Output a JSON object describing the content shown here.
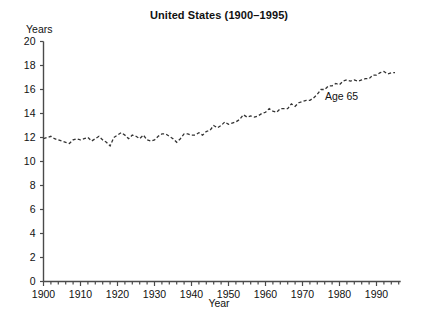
{
  "chart_data": {
    "type": "line",
    "title": "United States (1900–1995)",
    "xlabel": "Year",
    "ylabel": "Years",
    "xlim": [
      1900,
      1996
    ],
    "ylim": [
      0,
      20
    ],
    "grid": false,
    "legend_position": "inline-annotation",
    "line_style": "dashed",
    "line_color": "#333333",
    "annotations": [
      {
        "text": "Age 65",
        "x": 1982,
        "y": 15.4
      }
    ],
    "y_ticks": [
      0,
      2,
      4,
      6,
      8,
      10,
      12,
      14,
      16,
      18,
      20
    ],
    "x_ticks": [
      1900,
      1910,
      1920,
      1930,
      1940,
      1950,
      1960,
      1970,
      1980,
      1990
    ],
    "x_minor_tick_step": 2,
    "series": [
      {
        "name": "Age 65",
        "x": [
          1900,
          1901,
          1902,
          1903,
          1904,
          1905,
          1906,
          1907,
          1908,
          1909,
          1910,
          1911,
          1912,
          1913,
          1914,
          1915,
          1916,
          1917,
          1918,
          1919,
          1920,
          1921,
          1922,
          1923,
          1924,
          1925,
          1926,
          1927,
          1928,
          1929,
          1930,
          1931,
          1932,
          1933,
          1934,
          1935,
          1936,
          1937,
          1938,
          1939,
          1940,
          1941,
          1942,
          1943,
          1944,
          1945,
          1946,
          1947,
          1948,
          1949,
          1950,
          1951,
          1952,
          1953,
          1954,
          1955,
          1956,
          1957,
          1958,
          1959,
          1960,
          1961,
          1962,
          1963,
          1964,
          1965,
          1966,
          1967,
          1968,
          1969,
          1970,
          1971,
          1972,
          1973,
          1974,
          1975,
          1976,
          1977,
          1978,
          1979,
          1980,
          1981,
          1982,
          1983,
          1984,
          1985,
          1986,
          1987,
          1988,
          1989,
          1990,
          1991,
          1992,
          1993,
          1994,
          1995
        ],
        "values": [
          11.9,
          12.0,
          12.1,
          11.9,
          11.8,
          11.7,
          11.6,
          11.5,
          11.8,
          11.9,
          11.8,
          11.9,
          12.0,
          11.7,
          11.9,
          12.1,
          11.8,
          11.6,
          11.3,
          12.0,
          12.2,
          12.4,
          12.2,
          11.9,
          12.2,
          12.1,
          11.9,
          12.2,
          11.8,
          11.7,
          11.8,
          12.1,
          12.3,
          12.3,
          12.1,
          11.9,
          11.6,
          11.9,
          12.3,
          12.3,
          12.2,
          12.2,
          12.4,
          12.2,
          12.5,
          12.6,
          13.0,
          12.8,
          13.0,
          13.3,
          13.1,
          13.2,
          13.3,
          13.5,
          13.9,
          13.7,
          13.8,
          13.7,
          13.8,
          14.0,
          14.1,
          14.4,
          14.2,
          14.1,
          14.4,
          14.4,
          14.4,
          14.8,
          14.6,
          14.9,
          15.0,
          15.1,
          15.1,
          15.3,
          15.6,
          16.0,
          16.0,
          16.3,
          16.3,
          16.5,
          16.4,
          16.7,
          16.8,
          16.7,
          16.8,
          16.7,
          16.8,
          16.9,
          16.9,
          17.2,
          17.2,
          17.4,
          17.5,
          17.3,
          17.4,
          17.4
        ]
      }
    ]
  },
  "axis": {
    "y_tick_labels": [
      "0",
      "2",
      "4",
      "6",
      "8",
      "10",
      "12",
      "14",
      "16",
      "18",
      "20"
    ],
    "x_tick_labels": [
      "1900",
      "1910",
      "1920",
      "1930",
      "1940",
      "1950",
      "1960",
      "1970",
      "1980",
      "1990"
    ]
  }
}
